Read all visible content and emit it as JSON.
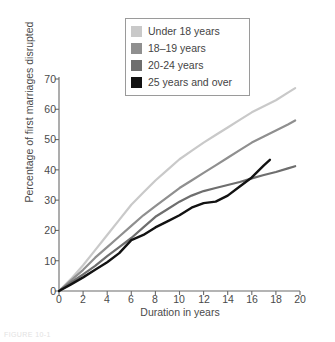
{
  "chart_data": {
    "type": "line",
    "title": "",
    "xlabel": "Duration in years",
    "ylabel": "Percentage of first marriages disrupted",
    "xlim": [
      0,
      20
    ],
    "ylim": [
      0,
      70
    ],
    "xticks": [
      "0",
      "2",
      "4",
      "6",
      "8",
      "10",
      "12",
      "14",
      "16",
      "18",
      "20"
    ],
    "yticks": [
      "0",
      "10",
      "20",
      "30",
      "40",
      "50",
      "60",
      "70"
    ],
    "grid": false,
    "legend_position": "top-center",
    "series": [
      {
        "name": "Under 18 years",
        "color": "#c9c9c9",
        "x": [
          0,
          1,
          2,
          3,
          4,
          5,
          6,
          7,
          8,
          9,
          10,
          11,
          12,
          13,
          14,
          15,
          16,
          17,
          18,
          19,
          19.6
        ],
        "values": [
          0,
          4.0,
          8.5,
          13.5,
          18.5,
          23.5,
          28.5,
          32.5,
          36.5,
          40.0,
          43.5,
          46.3,
          49.0,
          51.5,
          54.0,
          56.5,
          59.0,
          61.0,
          63.0,
          65.5,
          67.0
        ]
      },
      {
        "name": "18–19 years",
        "color": "#8f8f8f",
        "x": [
          0,
          1,
          2,
          3,
          4,
          5,
          6,
          7,
          8,
          9,
          10,
          11,
          12,
          13,
          14,
          15,
          16,
          17,
          18,
          19,
          19.6
        ],
        "values": [
          0,
          3.5,
          7.0,
          11.0,
          14.5,
          18.0,
          21.5,
          25.0,
          28.0,
          31.0,
          34.0,
          36.5,
          39.0,
          41.5,
          44.0,
          46.5,
          49.0,
          51.0,
          53.0,
          55.0,
          56.3
        ]
      },
      {
        "name": "20-24 years",
        "color": "#6e6e6e",
        "x": [
          0,
          1,
          2,
          3,
          4,
          5,
          6,
          7,
          8,
          9,
          10,
          11,
          12,
          13,
          14,
          15,
          16,
          17,
          18,
          19,
          19.6
        ],
        "values": [
          0,
          2.8,
          5.5,
          8.3,
          11.5,
          14.5,
          17.5,
          21.0,
          24.5,
          27.0,
          29.5,
          31.5,
          33.0,
          34.0,
          35.0,
          36.0,
          37.2,
          38.3,
          39.3,
          40.5,
          41.2
        ]
      },
      {
        "name": "25 years and over",
        "color": "#121212",
        "x": [
          0,
          1,
          2,
          3,
          4,
          5,
          6,
          7,
          8,
          9,
          10,
          11,
          12,
          13,
          14,
          15,
          16,
          17,
          17.5
        ],
        "values": [
          0,
          2.2,
          4.5,
          7.0,
          9.5,
          12.5,
          16.8,
          18.5,
          21.0,
          23.0,
          25.0,
          27.5,
          29.0,
          29.5,
          31.5,
          34.5,
          37.5,
          41.5,
          43.3
        ]
      }
    ]
  },
  "axes": {
    "y_tick_labels": [
      "70",
      "60",
      "50",
      "40",
      "30",
      "20",
      "10",
      "0"
    ],
    "x_tick_labels": [
      "0",
      "2",
      "4",
      "6",
      "8",
      "10",
      "12",
      "14",
      "16",
      "18",
      "20"
    ],
    "y_axis_title": "Percentage of first marriages disrupted",
    "x_axis_title": "Duration in years"
  },
  "legend": {
    "items": [
      {
        "label": "Under 18 years",
        "color": "#c9c9c9"
      },
      {
        "label": "18–19 years",
        "color": "#8f8f8f"
      },
      {
        "label": "20-24 years",
        "color": "#6e6e6e"
      },
      {
        "label": "25 years and over",
        "color": "#121212"
      }
    ]
  },
  "caption": {
    "text": "FIGURE 10-1"
  }
}
